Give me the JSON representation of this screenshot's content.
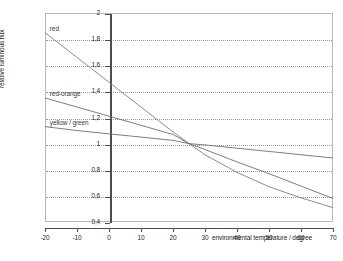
{
  "chart_data": {
    "type": "line",
    "title": "",
    "xlabel": "environmental temperature / degree",
    "ylabel": "relative luminous flux",
    "xlim": [
      -20,
      70
    ],
    "ylim": [
      0.4,
      2
    ],
    "xticks": [
      "-20",
      "-10",
      "0",
      "10",
      "20",
      "30",
      "40",
      "50",
      "60",
      "70"
    ],
    "xtick_values": [
      -20,
      -10,
      0,
      10,
      20,
      30,
      40,
      50,
      60,
      70
    ],
    "yticks": [
      "0,4",
      "0,6",
      "0,8",
      "1",
      "1,2",
      "1,4",
      "1,6",
      "1,8",
      "2"
    ],
    "ytick_values": [
      0.4,
      0.6,
      0.8,
      1.0,
      1.2,
      1.4,
      1.6,
      1.8,
      2.0
    ],
    "grid": "horizontal-dotted",
    "legend": "inline-annotations",
    "x": [
      -20,
      -10,
      0,
      10,
      20,
      25,
      30,
      40,
      50,
      60,
      70
    ],
    "series": [
      {
        "name": "red",
        "label": "red",
        "color": "#7f7f7f",
        "values": [
          1.85,
          1.66,
          1.47,
          1.28,
          1.09,
          1.0,
          0.915,
          0.78,
          0.67,
          0.585,
          0.51
        ]
      },
      {
        "name": "red-orange",
        "label": "red-orange",
        "color": "#6e6e6e",
        "values": [
          1.35,
          1.28,
          1.21,
          1.14,
          1.07,
          1.0,
          0.955,
          0.86,
          0.77,
          0.675,
          0.58
        ]
      },
      {
        "name": "yellow / green",
        "label": "yellow / green",
        "color": "#6e6e6e",
        "values": [
          1.13,
          1.1,
          1.075,
          1.05,
          1.025,
          1.0,
          0.99,
          0.965,
          0.94,
          0.915,
          0.89
        ]
      }
    ]
  },
  "axis": {
    "y_title": "relative luminous flux",
    "x_title": "environmental temperature / degree"
  },
  "annotations": {
    "red": "red",
    "red_orange": "red-orange",
    "yellow_green": "yellow / green"
  },
  "caption": {
    "text": ""
  }
}
